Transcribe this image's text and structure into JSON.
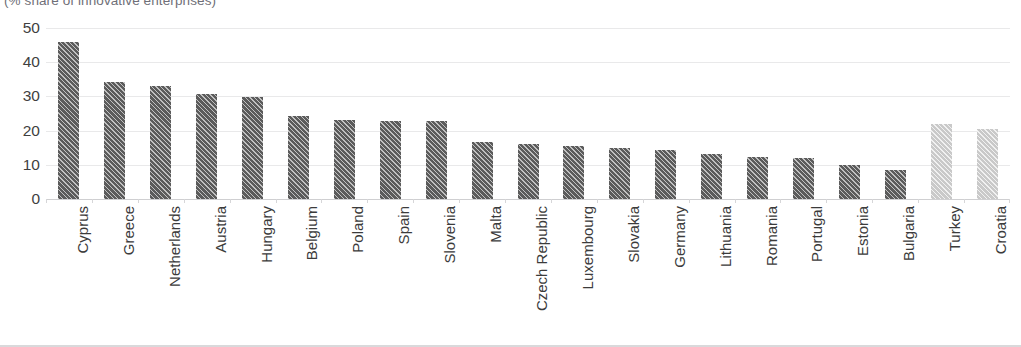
{
  "chart_data": {
    "type": "bar",
    "title": "",
    "subtitle": "(% share of innovative enterprises)",
    "xlabel": "",
    "ylabel": "",
    "ylim": [
      0,
      50
    ],
    "yticks": [
      0,
      10,
      20,
      30,
      40,
      50
    ],
    "grid": true,
    "legend": "none",
    "categories": [
      "Cyprus",
      "Greece",
      "Netherlands",
      "Austria",
      "Hungary",
      "Belgium",
      "Poland",
      "Spain",
      "Slovenia",
      "Malta",
      "Czech Republic",
      "Luxembourg",
      "Slovakia",
      "Germany",
      "Lithuania",
      "Romania",
      "Portugal",
      "Estonia",
      "Bulgaria",
      "Turkey",
      "Croatia"
    ],
    "values": [
      45.8,
      34.1,
      33.0,
      30.6,
      29.8,
      24.3,
      23.0,
      22.9,
      22.7,
      16.6,
      16.1,
      15.5,
      14.8,
      14.2,
      13.2,
      12.4,
      12.1,
      9.9,
      8.5,
      21.9,
      20.5
    ],
    "series_groups": [
      {
        "name": "EU member states",
        "color": "#5b5b5b",
        "style": "dark-hatch",
        "indices": [
          0,
          1,
          2,
          3,
          4,
          5,
          6,
          7,
          8,
          9,
          10,
          11,
          12,
          13,
          14,
          15,
          16,
          17,
          18
        ]
      },
      {
        "name": "Candidate countries",
        "color": "#c9c9c9",
        "style": "light-hatch",
        "indices": [
          19,
          20
        ]
      }
    ]
  },
  "colors": {
    "bar_dark": "#5b5b5b",
    "bar_light": "#c9c9c9",
    "gridline": "#e9e9ea",
    "axis": "#cfcfd1",
    "text": "#3b3b3b",
    "subtitle": "#6f6f78"
  }
}
